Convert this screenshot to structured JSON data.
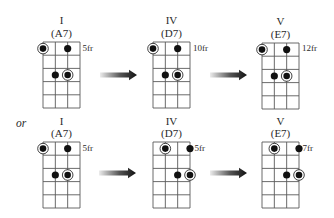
{
  "diagram": {
    "alternative_label": "or",
    "grid": {
      "strings": 4,
      "frets": 5
    },
    "colors": {
      "ink": "#111111",
      "grid": "#5a5a5a",
      "arrow_start": "#ececec",
      "arrow_end": "#111111",
      "background": "#ffffff"
    },
    "dot_types": {
      "root": "circled-dot",
      "note": "filled-dot"
    },
    "rows": [
      {
        "chords": [
          {
            "degree": "I",
            "chord": "(A7)",
            "fret_label": "5fr",
            "dots": [
              {
                "string": 1,
                "fret": 1,
                "type": "root"
              },
              {
                "string": 3,
                "fret": 1,
                "type": "note"
              },
              {
                "string": 2,
                "fret": 3,
                "type": "note"
              },
              {
                "string": 3,
                "fret": 3,
                "type": "root"
              }
            ]
          },
          {
            "degree": "IV",
            "chord": "(D7)",
            "fret_label": "10fr",
            "dots": [
              {
                "string": 1,
                "fret": 1,
                "type": "root"
              },
              {
                "string": 3,
                "fret": 1,
                "type": "note"
              },
              {
                "string": 2,
                "fret": 3,
                "type": "note"
              },
              {
                "string": 3,
                "fret": 3,
                "type": "root"
              }
            ]
          },
          {
            "degree": "V",
            "chord": "(E7)",
            "fret_label": "12fr",
            "dots": [
              {
                "string": 1,
                "fret": 1,
                "type": "root"
              },
              {
                "string": 3,
                "fret": 1,
                "type": "note"
              },
              {
                "string": 2,
                "fret": 3,
                "type": "note"
              },
              {
                "string": 3,
                "fret": 3,
                "type": "root"
              }
            ]
          }
        ]
      },
      {
        "chords": [
          {
            "degree": "I",
            "chord": "(A7)",
            "fret_label": "5fr",
            "dots": [
              {
                "string": 1,
                "fret": 1,
                "type": "root"
              },
              {
                "string": 3,
                "fret": 1,
                "type": "note"
              },
              {
                "string": 2,
                "fret": 3,
                "type": "note"
              },
              {
                "string": 3,
                "fret": 3,
                "type": "root"
              }
            ]
          },
          {
            "degree": "IV",
            "chord": "(D7)",
            "fret_label": "5fr",
            "dots": [
              {
                "string": 2,
                "fret": 1,
                "type": "root"
              },
              {
                "string": 4,
                "fret": 1,
                "type": "note"
              },
              {
                "string": 3,
                "fret": 3,
                "type": "note"
              },
              {
                "string": 4,
                "fret": 3,
                "type": "root"
              }
            ]
          },
          {
            "degree": "V",
            "chord": "(E7)",
            "fret_label": "7fr",
            "dots": [
              {
                "string": 2,
                "fret": 1,
                "type": "root"
              },
              {
                "string": 4,
                "fret": 1,
                "type": "note"
              },
              {
                "string": 3,
                "fret": 3,
                "type": "note"
              },
              {
                "string": 4,
                "fret": 3,
                "type": "root"
              }
            ]
          }
        ]
      }
    ],
    "arrows": [
      {
        "icon": "right-arrow-icon"
      },
      {
        "icon": "right-arrow-icon"
      },
      {
        "icon": "right-arrow-icon"
      },
      {
        "icon": "right-arrow-icon"
      }
    ]
  }
}
